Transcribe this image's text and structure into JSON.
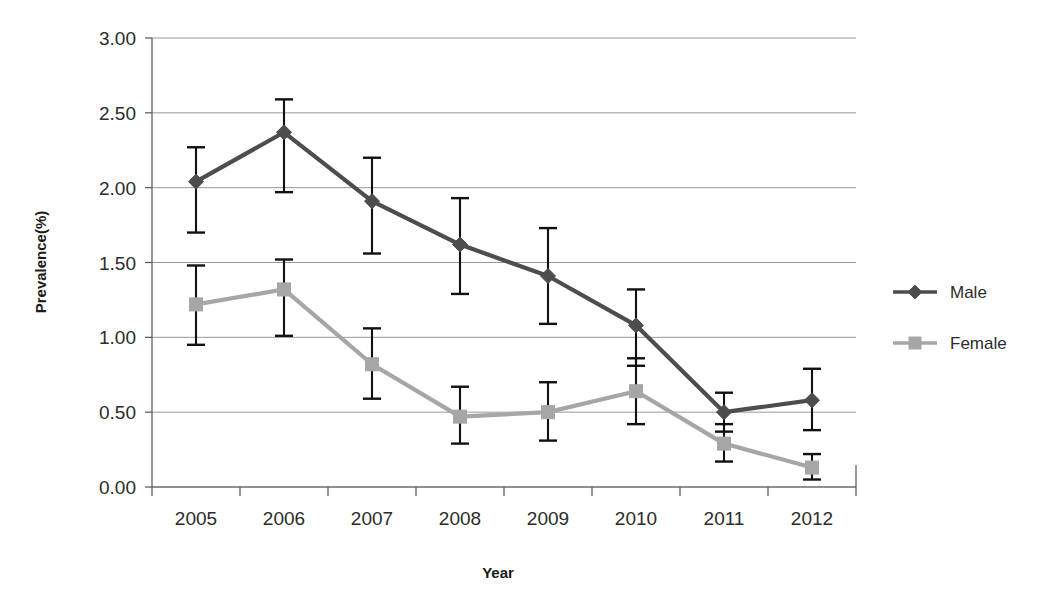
{
  "chart_data": {
    "type": "line",
    "title": "",
    "subtitle": "",
    "xlabel": "Year",
    "ylabel": "Prevalence(%)",
    "categories": [
      "2005",
      "2006",
      "2007",
      "2008",
      "2009",
      "2010",
      "2011",
      "2012"
    ],
    "ylim": [
      0.0,
      3.0
    ],
    "ytick_step": 0.5,
    "ytick_labels": [
      "0.00",
      "0.50",
      "1.00",
      "1.50",
      "2.00",
      "2.50",
      "3.00"
    ],
    "ytick_values": [
      0.0,
      0.5,
      1.0,
      1.5,
      2.0,
      2.5,
      3.0
    ],
    "grid": "horizontal",
    "legend_position": "right",
    "error_bars": true,
    "series": [
      {
        "name": "Male",
        "color": "#4d4d4d",
        "marker": "diamond",
        "values": [
          2.04,
          2.37,
          1.91,
          1.62,
          1.41,
          1.08,
          0.5,
          0.58
        ],
        "err_low": [
          1.7,
          1.97,
          1.56,
          1.29,
          1.09,
          0.81,
          0.37,
          0.38
        ],
        "err_high": [
          2.27,
          2.59,
          2.2,
          1.93,
          1.73,
          1.32,
          0.63,
          0.79
        ]
      },
      {
        "name": "Female",
        "color": "#a6a6a6",
        "marker": "square",
        "values": [
          1.22,
          1.32,
          0.82,
          0.47,
          0.5,
          0.64,
          0.29,
          0.13
        ],
        "err_low": [
          0.95,
          1.01,
          0.59,
          0.29,
          0.31,
          0.42,
          0.17,
          0.05
        ],
        "err_high": [
          1.48,
          1.52,
          1.06,
          0.67,
          0.7,
          0.86,
          0.42,
          0.22
        ]
      }
    ]
  },
  "legend": {
    "items": [
      {
        "label": "Male"
      },
      {
        "label": "Female"
      }
    ]
  },
  "axes": {
    "x_title": "Year",
    "y_title": "Prevalence(%)"
  },
  "colors": {
    "male": "#4d4d4d",
    "female": "#a6a6a6",
    "gridline": "#999999",
    "axis": "#555555",
    "errorbar": "#111111",
    "background": "#ffffff"
  }
}
